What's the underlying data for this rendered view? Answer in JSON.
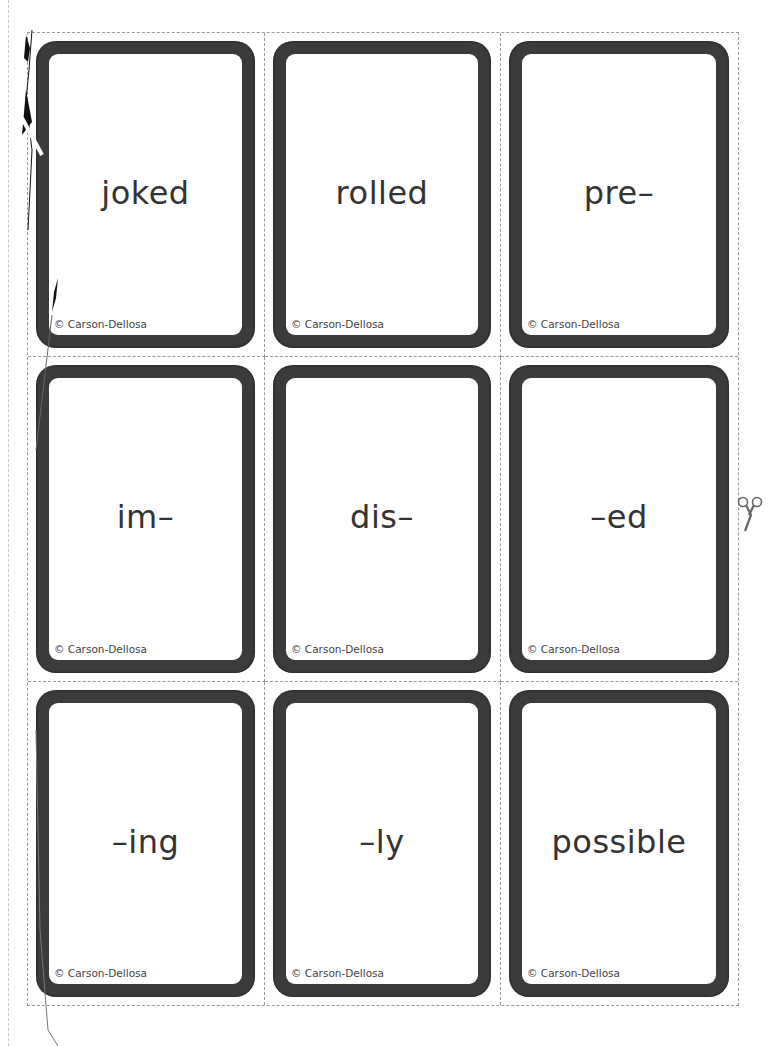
{
  "sheet": {
    "copyright": "© Carson-Dellosa",
    "colors": {
      "card_border": "#3b3b3b",
      "cut_line": "#9a9a9a",
      "text": "#333333"
    },
    "cards": [
      {
        "word": "joked",
        "copyright": "© Carson-Dellosa"
      },
      {
        "word": "rolled",
        "copyright": "© Carson-Dellosa"
      },
      {
        "word": "pre–",
        "copyright": "© Carson-Dellosa"
      },
      {
        "word": "im–",
        "copyright": "© Carson-Dellosa"
      },
      {
        "word": "dis–",
        "copyright": "© Carson-Dellosa"
      },
      {
        "word": "–ed",
        "copyright": "© Carson-Dellosa"
      },
      {
        "word": "–ing",
        "copyright": "© Carson-Dellosa"
      },
      {
        "word": "–ly",
        "copyright": "© Carson-Dellosa"
      },
      {
        "word": "possible",
        "copyright": "© Carson-Dellosa"
      }
    ],
    "icons": {
      "cut_marker": "scissors-icon"
    }
  }
}
